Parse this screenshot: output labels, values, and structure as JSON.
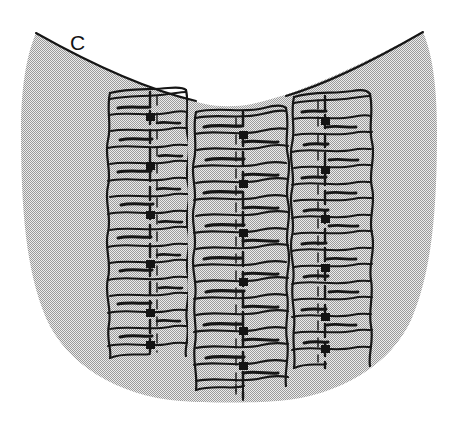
{
  "figure": {
    "panel_label": "C",
    "label_position": {
      "x": 70,
      "y": 32
    },
    "background_color": "#ffffff",
    "fill_color": "#d8d8d8",
    "halftone_dot_color": "#8c8c8c",
    "ink_color": "#1a1a1a",
    "canvas": {
      "width": 457,
      "height": 424
    },
    "body_outline": {
      "description": "U-shaped stippled body, concave top edge, rounded bottom",
      "top_left_point": {
        "x": 36,
        "y": 33
      },
      "top_right_point": {
        "x": 423,
        "y": 32
      },
      "top_mid_dip": {
        "x": 228,
        "y": 104
      },
      "bottom_point": {
        "x": 228,
        "y": 400
      },
      "left_extreme_x": 22,
      "right_extreme_x": 437
    },
    "columns": [
      {
        "name": "left-column",
        "x_center": 145,
        "width": 80,
        "top_y": 92,
        "bottom_y": 356,
        "rung_count": 16,
        "midline_x": 150,
        "midline_style": "dashed"
      },
      {
        "name": "center-column",
        "x_center": 240,
        "width": 96,
        "top_y": 112,
        "bottom_y": 392,
        "rung_count": 17,
        "midline_x": 243,
        "midline_style": "dashed"
      },
      {
        "name": "right-column",
        "x_center": 330,
        "width": 80,
        "top_y": 96,
        "bottom_y": 366,
        "rung_count": 16,
        "midline_x": 325,
        "midline_style": "dashed"
      }
    ]
  }
}
